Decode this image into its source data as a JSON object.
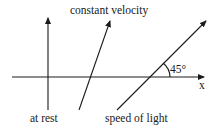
{
  "diagram": {
    "type": "spacetime-worldlines",
    "axis": {
      "label": "x"
    },
    "worldlines": [
      {
        "id": "at-rest",
        "label": "at rest"
      },
      {
        "id": "constant-velocity",
        "label": "constant velocity"
      },
      {
        "id": "speed-of-light",
        "label": "speed of light"
      }
    ],
    "angle_label": "45°",
    "colors": {
      "ink": "#1a1a1a",
      "background": "#ffffff"
    }
  }
}
